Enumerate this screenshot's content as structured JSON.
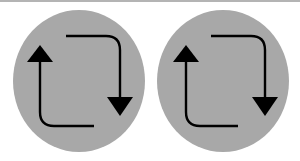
{
  "image": {
    "width": 300,
    "height": 161,
    "background_color": "#ffffff",
    "top_edge_line_color": "#b4b4b4",
    "description": "Two identical gray circles side by side, each containing a pair of black curved arrows forming a cyclic refresh motif"
  },
  "palette": {
    "circle_fill": "#a8a8a8",
    "arrow_stroke": "#000000",
    "arrow_fill": "#000000",
    "page_background": "#ffffff"
  },
  "figures": [
    {
      "id": "left",
      "name": "left-recycle-circle",
      "circle": {
        "cx": 79,
        "cy": 81,
        "rx": 66,
        "ry": 71
      },
      "arrows": [
        {
          "id": "left-up-arrow",
          "direction": "up",
          "name": "up-arrow",
          "stem_x": 40,
          "stem_top_y": 60,
          "stem_bottom_y": 112,
          "elbow_radius": 14,
          "tail_x": 94,
          "tail_y": 126,
          "head_tip_x": 40,
          "head_tip_y": 45,
          "head_base_y": 62,
          "head_half_width": 13
        },
        {
          "id": "left-down-arrow",
          "direction": "down",
          "name": "down-arrow",
          "stem_x": 120,
          "stem_top_y": 50,
          "stem_bottom_y": 98,
          "elbow_radius": 14,
          "tail_x": 66,
          "tail_y": 36,
          "head_tip_x": 120,
          "head_tip_y": 116,
          "head_base_y": 97,
          "head_half_width": 13
        }
      ]
    },
    {
      "id": "right",
      "name": "right-recycle-circle",
      "circle": {
        "cx": 223,
        "cy": 81,
        "rx": 66,
        "ry": 71
      },
      "arrows": [
        {
          "id": "right-up-arrow",
          "direction": "up",
          "name": "up-arrow",
          "stem_x": 186,
          "stem_top_y": 60,
          "stem_bottom_y": 112,
          "elbow_radius": 14,
          "tail_x": 238,
          "tail_y": 126,
          "head_tip_x": 186,
          "head_tip_y": 45,
          "head_base_y": 62,
          "head_half_width": 13
        },
        {
          "id": "right-down-arrow",
          "direction": "down",
          "name": "down-arrow",
          "stem_x": 265,
          "stem_top_y": 50,
          "stem_bottom_y": 98,
          "elbow_radius": 14,
          "tail_x": 211,
          "tail_y": 36,
          "head_tip_x": 265,
          "head_tip_y": 116,
          "head_base_y": 97,
          "head_half_width": 13
        }
      ]
    }
  ],
  "geometry": {
    "stroke_width": 2.4
  }
}
